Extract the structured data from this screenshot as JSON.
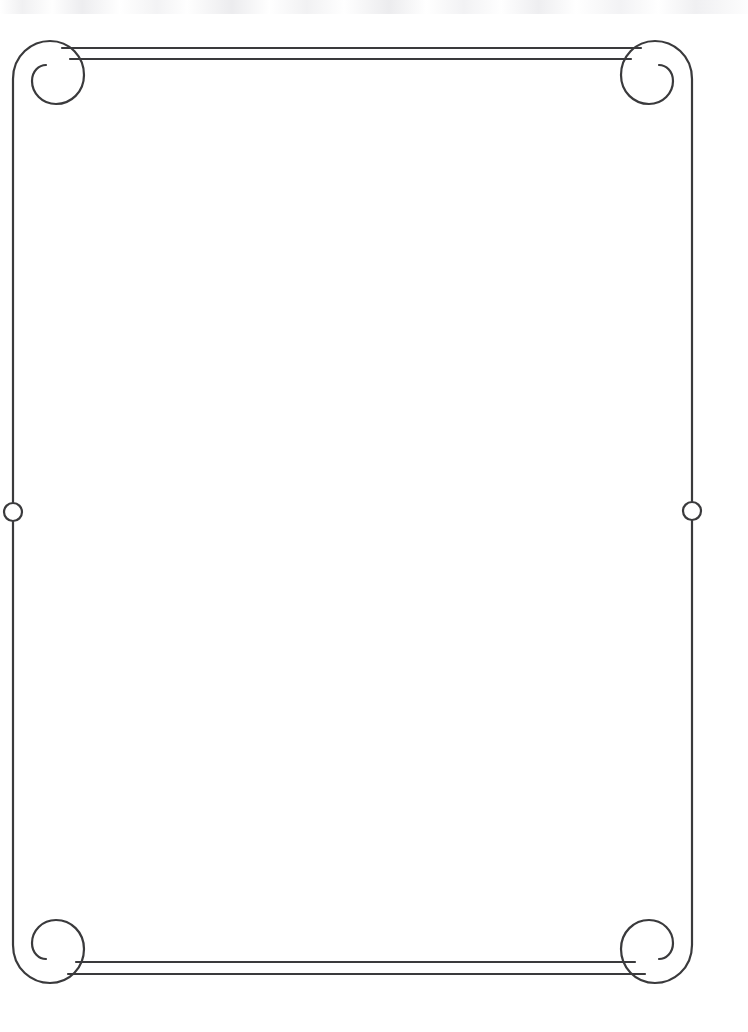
{
  "document": {
    "kind": "decorative-page-border",
    "title": "",
    "body_text": "",
    "page_width": 748,
    "page_height": 1032,
    "background_color": "#ffffff",
    "ink_color": "#3a3a3c",
    "content_is_blank": true
  },
  "border": {
    "style_name": "scrolled-volute-frame",
    "stroke_color": "#3a3a3c",
    "stroke_width": 2.2,
    "left_rule_x": 13,
    "right_rule_x": 692,
    "top_outer_rule_y": 48,
    "top_inner_rule_y": 59,
    "bottom_outer_rule_y": 962,
    "bottom_inner_rule_y": 974,
    "top_outer_rule_start_x": 62,
    "top_outer_rule_end_x": 641,
    "top_inner_rule_start_x": 70,
    "top_inner_rule_end_x": 631,
    "bottom_outer_rule_start_x": 76,
    "bottom_outer_rule_end_x": 635,
    "bottom_inner_rule_start_x": 68,
    "bottom_inner_rule_end_x": 645
  },
  "ornaments": {
    "corner_scrolls": [
      {
        "name": "top-left-scroll",
        "cx": 44,
        "cy": 79
      },
      {
        "name": "top-right-scroll",
        "cx": 654,
        "cy": 79
      },
      {
        "name": "bottom-left-scroll",
        "cx": 51,
        "cy": 945
      },
      {
        "name": "bottom-right-scroll",
        "cx": 661,
        "cy": 945
      }
    ],
    "side_circles": [
      {
        "name": "left-side-circle",
        "cx": 13,
        "cy": 512,
        "r": 9
      },
      {
        "name": "right-side-circle",
        "cx": 692,
        "cy": 511,
        "r": 9
      }
    ]
  },
  "scan": {
    "top_edge_artifact": true
  }
}
